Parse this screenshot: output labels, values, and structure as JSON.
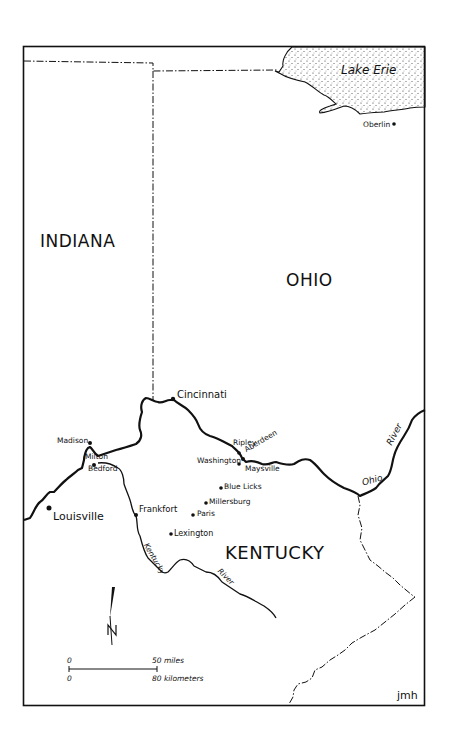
{
  "map": {
    "states": [
      {
        "name": "INDIANA"
      },
      {
        "name": "OHIO"
      },
      {
        "name": "KENTUCKY"
      }
    ],
    "water": {
      "lake": "Lake Erie",
      "river_ohio_1": "Ohio",
      "river_ohio_2": "River",
      "river_kentucky_1": "Kentucky",
      "river_kentucky_2": "River"
    },
    "cities": [
      {
        "name": "Oberlin"
      },
      {
        "name": "Cincinnati"
      },
      {
        "name": "Madison"
      },
      {
        "name": "Milton"
      },
      {
        "name": "Bedford"
      },
      {
        "name": "Louisville"
      },
      {
        "name": "Ripley"
      },
      {
        "name": "Aberdeen"
      },
      {
        "name": "Washington"
      },
      {
        "name": "Maysville"
      },
      {
        "name": "Blue Licks"
      },
      {
        "name": "Millersburg"
      },
      {
        "name": "Paris"
      },
      {
        "name": "Frankfort"
      },
      {
        "name": "Lexington"
      }
    ],
    "north_arrow": "N",
    "scale": {
      "miles_start": "0",
      "miles_end": "50 miles",
      "km_start": "0",
      "km_end": "80 kilometers"
    },
    "signature": "jmh",
    "colors": {
      "ink": "#111111",
      "background": "#ffffff"
    }
  }
}
